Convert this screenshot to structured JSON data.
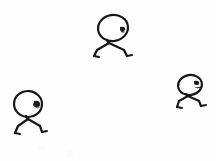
{
  "canvas": {
    "width": 216,
    "height": 161,
    "background_color": "#fffefe",
    "ink_color": "#1a1616",
    "title": "Three stick figures sketch",
    "description": "A rough hand-drawn sketch on a plain white background showing three simple stick figures, each with an oval head bearing a small dark face mark on the right side and two thin splayed legs with small feet."
  },
  "figures": [
    {
      "id": "figure-top-center",
      "name": "stick-figure-top-center",
      "label": "Top center stick figure",
      "head": {
        "center_x": 113,
        "center_y": 28,
        "radius_x": 15,
        "radius_y": 13,
        "rotation": -8,
        "stroke_width": 2.2
      },
      "face_mark": {
        "x": 122,
        "y": 30,
        "width": 5,
        "height": 4,
        "label": "face-mark"
      },
      "neck": {
        "x1": 107,
        "y1": 40,
        "x2": 109,
        "y2": 43,
        "stroke_width": 2.4
      },
      "legs": [
        {
          "name": "left-leg",
          "path": "M 109 43 L 97 50 L 94 56",
          "stroke_width": 2.3,
          "foot": {
            "path": "M 94 56 L 99 57",
            "stroke_width": 2.0
          }
        },
        {
          "name": "right-leg",
          "path": "M 109 43 L 124 50 L 127 56",
          "stroke_width": 2.3,
          "foot": {
            "path": "M 127 56 L 132 55",
            "stroke_width": 2.0
          }
        }
      ]
    },
    {
      "id": "figure-bottom-left",
      "name": "stick-figure-bottom-left",
      "label": "Bottom left stick figure",
      "head": {
        "center_x": 28,
        "center_y": 104,
        "radius_x": 14,
        "radius_y": 13,
        "rotation": 6,
        "stroke_width": 2.2
      },
      "face_mark": {
        "x": 36,
        "y": 104,
        "width": 5,
        "height": 5,
        "label": "face-mark"
      },
      "neck": {
        "x1": 26,
        "y1": 116,
        "x2": 28,
        "y2": 119,
        "stroke_width": 2.4
      },
      "legs": [
        {
          "name": "left-leg",
          "path": "M 28 119 L 18 126 L 15 133",
          "stroke_width": 2.3,
          "foot": {
            "path": "M 15 133 L 20 134",
            "stroke_width": 2.0
          }
        },
        {
          "name": "right-leg",
          "path": "M 28 119 L 40 126 L 42 132",
          "stroke_width": 2.3,
          "foot": {
            "path": "M 42 132 L 47 131",
            "stroke_width": 2.0
          }
        }
      ]
    },
    {
      "id": "figure-right",
      "name": "stick-figure-right",
      "label": "Right side stick figure",
      "head": {
        "center_x": 190,
        "center_y": 85,
        "radius_x": 12,
        "radius_y": 10,
        "rotation": -10,
        "stroke_width": 2.1
      },
      "face_mark": {
        "x": 196,
        "y": 84,
        "width": 5,
        "height": 4,
        "label": "face-mark"
      },
      "neck": {
        "x1": 186,
        "y1": 94,
        "x2": 188,
        "y2": 96,
        "stroke_width": 2.3
      },
      "legs": [
        {
          "name": "left-leg",
          "path": "M 188 96 L 179 101 L 177 107",
          "stroke_width": 2.2,
          "foot": {
            "path": "M 177 107 L 182 108",
            "stroke_width": 1.9
          }
        },
        {
          "name": "right-leg",
          "path": "M 188 96 L 199 101 L 201 106",
          "stroke_width": 2.2,
          "foot": {
            "path": "M 201 106 L 206 105",
            "stroke_width": 1.9
          }
        }
      ]
    }
  ],
  "smudges": [
    {
      "name": "faint-smudge-1",
      "x": 38,
      "y": 146,
      "width": 8,
      "height": 5
    },
    {
      "name": "faint-smudge-2",
      "x": 66,
      "y": 150,
      "width": 7,
      "height": 8
    }
  ]
}
